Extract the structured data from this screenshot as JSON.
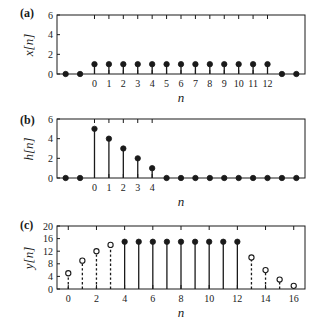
{
  "figure": {
    "title": "",
    "background": "#ffffff",
    "ink": "#1a1a1a"
  },
  "panels": {
    "a": {
      "tag": "(a)",
      "ylabel": "x[n]",
      "xlabel": "n"
    },
    "b": {
      "tag": "(b)",
      "ylabel": "h[n]",
      "xlabel": "n"
    },
    "c": {
      "tag": "(c)",
      "ylabel": "y[n]",
      "xlabel": "n"
    }
  },
  "chart_data": [
    {
      "type": "line",
      "panel": "a",
      "title": "",
      "xlabel": "n",
      "ylabel": "x[n]",
      "xlim": [
        -2.6,
        14.6
      ],
      "ylim": [
        0,
        6
      ],
      "xticks": [
        0,
        1,
        2,
        3,
        4,
        5,
        6,
        7,
        8,
        9,
        10,
        11,
        12
      ],
      "xticklabels": [
        "0",
        "1",
        "2",
        "3",
        "4",
        "5",
        "6",
        "7",
        "8",
        "9",
        "10",
        "11",
        "12"
      ],
      "yticks": [
        0,
        2,
        4,
        6
      ],
      "yticklabels": [
        "0",
        "2",
        "4",
        "6"
      ],
      "grid": false,
      "legend": false,
      "marker": "filled-circle",
      "stem": "solid",
      "x": [
        -2,
        -1,
        0,
        1,
        2,
        3,
        4,
        5,
        6,
        7,
        8,
        9,
        10,
        11,
        12,
        13,
        14
      ],
      "values": [
        0,
        0,
        1,
        1,
        1,
        1,
        1,
        1,
        1,
        1,
        1,
        1,
        1,
        1,
        1,
        0,
        0
      ]
    },
    {
      "type": "line",
      "panel": "b",
      "title": "",
      "xlabel": "n",
      "ylabel": "h[n]",
      "xlim": [
        -2.6,
        14.6
      ],
      "ylim": [
        0,
        6
      ],
      "xticks": [
        0,
        1,
        2,
        3,
        4
      ],
      "xticklabels": [
        "0",
        "1",
        "2",
        "3",
        "4"
      ],
      "yticks": [
        0,
        2,
        4,
        6
      ],
      "yticklabels": [
        "0",
        "2",
        "4",
        "6"
      ],
      "grid": false,
      "legend": false,
      "marker": "filled-circle",
      "stem": "solid",
      "x": [
        -2,
        -1,
        0,
        1,
        2,
        3,
        4,
        5,
        6,
        7,
        8,
        9,
        10,
        11,
        12,
        13,
        14
      ],
      "values": [
        0,
        0,
        5,
        4,
        3,
        2,
        1,
        0,
        0,
        0,
        0,
        0,
        0,
        0,
        0,
        0,
        0
      ]
    },
    {
      "type": "line",
      "panel": "c",
      "title": "",
      "xlabel": "n",
      "ylabel": "y[n]",
      "xlim": [
        -0.8,
        16.8
      ],
      "ylim": [
        0,
        20
      ],
      "xticks": [
        0,
        2,
        4,
        6,
        8,
        10,
        12,
        14,
        16
      ],
      "xticklabels": [
        "0",
        "2",
        "4",
        "6",
        "8",
        "10",
        "12",
        "14",
        "16"
      ],
      "yticks": [
        0,
        4,
        8,
        12,
        16,
        20
      ],
      "yticklabels": [
        "0",
        "4",
        "8",
        "12",
        "16",
        "20"
      ],
      "grid": false,
      "legend": false,
      "x": [
        0,
        1,
        2,
        3,
        4,
        5,
        6,
        7,
        8,
        9,
        10,
        11,
        12,
        13,
        14,
        15,
        16
      ],
      "values": [
        5,
        9,
        12,
        14,
        15,
        15,
        15,
        15,
        15,
        15,
        15,
        15,
        15,
        10,
        6,
        3,
        1
      ],
      "markers": [
        "open",
        "open",
        "open",
        "open",
        "filled",
        "filled",
        "filled",
        "filled",
        "filled",
        "filled",
        "filled",
        "filled",
        "filled",
        "open",
        "open",
        "open",
        "open"
      ],
      "stems": [
        "dashed",
        "dashed",
        "dashed",
        "dashed",
        "solid",
        "solid",
        "solid",
        "solid",
        "solid",
        "solid",
        "solid",
        "solid",
        "solid",
        "dashed",
        "dashed",
        "dashed",
        "dashed"
      ]
    }
  ]
}
